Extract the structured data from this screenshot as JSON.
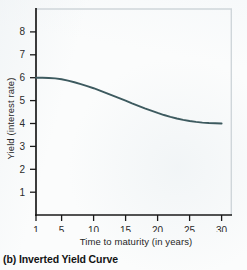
{
  "figure": {
    "caption": "(b) Inverted Yield Curve",
    "background_color": "#fbfcfc",
    "curve_color": "#3d5a5f",
    "axis_color": "#1a1a1a",
    "frame_color": "#cfd6da"
  },
  "chart_data": {
    "type": "line",
    "title": "",
    "subtitle": "",
    "xlabel": "Time to maturity (in years)",
    "ylabel": "Yield (interest rate)",
    "xlim": [
      0,
      32
    ],
    "ylim": [
      0,
      8.8
    ],
    "xticks": [
      1,
      5,
      10,
      15,
      20,
      25,
      30
    ],
    "xtick_labels": [
      "1",
      "5",
      "10",
      "15",
      "20",
      "25",
      "30"
    ],
    "yticks": [
      1,
      2,
      3,
      4,
      5,
      6,
      7,
      8
    ],
    "ytick_labels": [
      "1",
      "2",
      "3",
      "4",
      "5",
      "6",
      "7",
      "8"
    ],
    "grid": false,
    "legend": null,
    "annotations": [],
    "series": [
      {
        "name": "Inverted yield curve",
        "color": "#3d5a5f",
        "x": [
          1,
          2,
          3,
          4,
          5,
          6,
          7,
          8,
          9,
          10,
          11,
          12,
          13,
          14,
          15,
          16,
          17,
          18,
          19,
          20,
          21,
          22,
          23,
          24,
          25,
          26,
          27,
          28,
          29,
          30
        ],
        "values": [
          6.0,
          6.0,
          5.99,
          5.97,
          5.93,
          5.87,
          5.8,
          5.72,
          5.63,
          5.54,
          5.44,
          5.33,
          5.22,
          5.11,
          5.0,
          4.88,
          4.77,
          4.66,
          4.56,
          4.46,
          4.37,
          4.29,
          4.22,
          4.16,
          4.11,
          4.07,
          4.04,
          4.02,
          4.01,
          4.0
        ]
      }
    ]
  }
}
